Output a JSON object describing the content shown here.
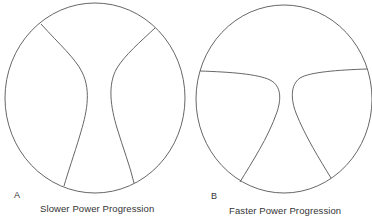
{
  "figure": {
    "stroke_color": "#555555",
    "background": "#ffffff",
    "panels": [
      {
        "id": "A",
        "label": "A",
        "caption": "Slower Power Progression",
        "description": "Circle divided by two vertical hourglass-like curves forming a narrow central channel"
      },
      {
        "id": "B",
        "label": "B",
        "caption": "Faster Power Progression",
        "description": "Circle divided by two curves that run horizontally from the sides then bend sharply downward, forming a Y-shaped central region"
      }
    ]
  }
}
